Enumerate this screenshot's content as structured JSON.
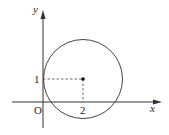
{
  "diagram": {
    "type": "coordinate-plane-circle",
    "axes": {
      "x_label": "x",
      "y_label": "y",
      "origin_label": "O"
    },
    "circle": {
      "center": [
        2,
        1
      ],
      "center_x_tick_label": "2",
      "center_y_tick_label": "1"
    },
    "colors": {
      "stroke": "#333333",
      "background": "#ffffff"
    }
  }
}
